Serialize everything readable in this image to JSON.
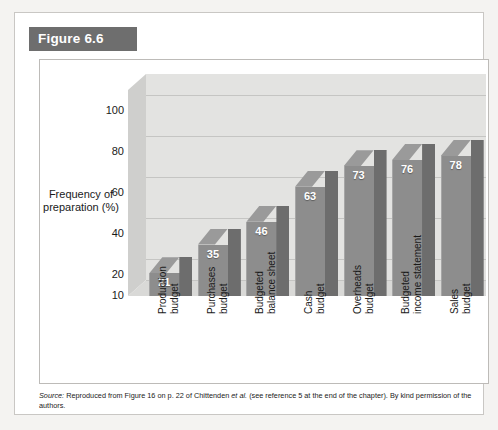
{
  "figure": {
    "banner_label": "Figure 6.6",
    "banner_color": "#6e6e6e"
  },
  "caption": {
    "source_word": "Source:",
    "text_part1": " Reproduced from Figure 16 on p. 22 of Chittenden ",
    "etal": "et al.",
    "text_part2": " (see reference 5 at the end of the chapter). By kind permission of the authors."
  },
  "chart_data": {
    "type": "bar",
    "title": "Figure 6.6",
    "categories": [
      "Production budget",
      "Purchases budget",
      "Budgeted balance sheet",
      "Cash budget",
      "Overheads budget",
      "Budgeted income statement",
      "Sales budget"
    ],
    "category_lines": [
      [
        "Production",
        "budget"
      ],
      [
        "Purchases",
        "budget"
      ],
      [
        "Budgeted",
        "balance sheet"
      ],
      [
        "Cash",
        "budget"
      ],
      [
        "Overheads",
        "budget"
      ],
      [
        "Budgeted",
        "income statement"
      ],
      [
        "Sales",
        "budget"
      ]
    ],
    "values": [
      21,
      35,
      46,
      63,
      73,
      76,
      78
    ],
    "xlabel": "",
    "ylabel": "Frequency of preparation (%)",
    "ylabel_lines": [
      "Frequency",
      "of",
      "preparation",
      "(%)"
    ],
    "yticks": [
      100,
      80,
      60,
      40,
      20,
      10
    ],
    "ylim": [
      10,
      110
    ],
    "grid": true,
    "legend": "none",
    "bar_color": "#8d8d8d",
    "bar_side_color": "#6d6d6d",
    "bar_top_color": "#9a9a9a",
    "plot_bg_color": "#e3e3e1",
    "value_label_color": "#ffffff"
  }
}
